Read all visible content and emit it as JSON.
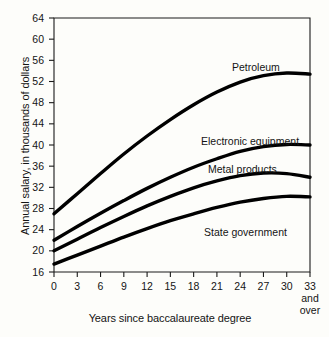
{
  "chart_data": {
    "type": "line",
    "title": "",
    "xlabel": "Years since baccalaureate degree",
    "ylabel": "Annual salary, in thousands of dollars",
    "xlim": [
      0,
      33
    ],
    "ylim": [
      16,
      64
    ],
    "xticks": [
      "0",
      "3",
      "6",
      "9",
      "12",
      "15",
      "18",
      "21",
      "24",
      "27",
      "30",
      "33"
    ],
    "xtick_values": [
      0,
      3,
      6,
      9,
      12,
      15,
      18,
      21,
      24,
      27,
      30,
      33
    ],
    "xtick_last_sub1": "and",
    "xtick_last_sub2": "over",
    "yticks": [
      "16",
      "20",
      "24",
      "28",
      "32",
      "36",
      "40",
      "44",
      "48",
      "52",
      "56",
      "60",
      "64"
    ],
    "ytick_values": [
      16,
      20,
      24,
      28,
      32,
      36,
      40,
      44,
      48,
      52,
      56,
      60,
      64
    ],
    "grid": false,
    "legend_position": "inline-labels",
    "x": [
      0,
      3,
      6,
      9,
      12,
      15,
      18,
      21,
      24,
      27,
      30,
      33
    ],
    "series": [
      {
        "name": "Petroleum",
        "label": "Petroleum",
        "color": "#000000",
        "label_x": 232,
        "label_y": 62,
        "values": [
          27.0,
          30.8,
          34.6,
          38.3,
          41.7,
          44.8,
          47.6,
          50.0,
          51.9,
          53.1,
          53.6,
          53.4
        ]
      },
      {
        "name": "Electronic equipment",
        "label": "Electronic equipment",
        "color": "#000000",
        "label_x": 201,
        "label_y": 136,
        "values": [
          22.0,
          24.6,
          27.1,
          29.5,
          31.8,
          33.9,
          35.8,
          37.4,
          38.8,
          39.7,
          40.1,
          40.0
        ]
      },
      {
        "name": "Metal products",
        "label": "Metal products",
        "color": "#000000",
        "label_x": 208,
        "label_y": 164,
        "values": [
          20.0,
          22.2,
          24.4,
          26.5,
          28.5,
          30.3,
          31.9,
          33.2,
          34.2,
          34.7,
          34.6,
          33.9
        ]
      },
      {
        "name": "State government",
        "label": "State government",
        "color": "#000000",
        "label_x": 204,
        "label_y": 227,
        "values": [
          17.5,
          19.2,
          20.9,
          22.6,
          24.2,
          25.7,
          27.0,
          28.2,
          29.2,
          29.9,
          30.3,
          30.2
        ]
      }
    ]
  },
  "style": {
    "axis_color": "#1a1a1a",
    "line_color": "#000000",
    "background": "#fdfdfa"
  }
}
